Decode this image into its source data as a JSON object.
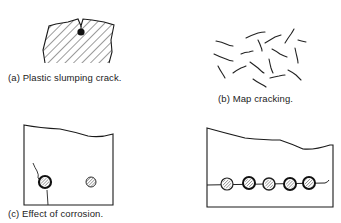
{
  "figure": {
    "panels": [
      {
        "id": "a",
        "caption": "(a)  Plastic slumping crack."
      },
      {
        "id": "b",
        "caption": "(b)  Map cracking."
      },
      {
        "id": "c",
        "caption": "(c)  Effect of corrosion."
      },
      {
        "id": "d",
        "caption": ""
      }
    ]
  },
  "colors": {
    "ink": "#1a1a1a",
    "background": "#ffffff"
  }
}
